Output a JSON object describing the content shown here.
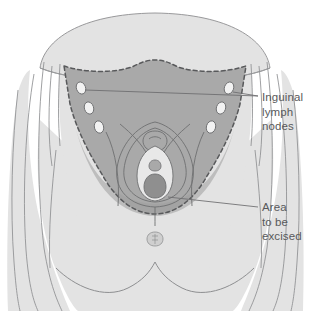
{
  "figure": {
    "domain": "medical-illustration",
    "background_color": "#ffffff"
  },
  "colors": {
    "skin_light": "#e3e3e3",
    "skin_mid": "#dcdcdc",
    "excision_gray": "#a9a9a9",
    "excision_gray_dark": "#9b9b9b",
    "node_fill": "#f2f2f2",
    "outline": "#6e6f71",
    "dashed_border": "#5f6062",
    "leader_line": "#6b6c6e",
    "text": "#58595b"
  },
  "labels": [
    {
      "id": "inguinal-lymph-nodes",
      "lines": [
        "Inguinal",
        "lymph",
        "nodes"
      ],
      "x": 262,
      "y": 90,
      "leaders": 2
    },
    {
      "id": "area-to-be-excised",
      "lines": [
        "Area",
        "to be",
        "excised"
      ],
      "x": 262,
      "y": 200,
      "leaders": 1
    }
  ],
  "anatomy": {
    "abdomen_label": "lower abdomen",
    "excision_area_label": "area to be excised",
    "lymph_nodes": {
      "count": 6,
      "left_chain": 3,
      "right_chain": 3
    },
    "structures": [
      "mons pubis",
      "labia majora",
      "labia minora",
      "clitoris",
      "vaginal introitus",
      "urethral meatus",
      "anus",
      "thigh"
    ]
  }
}
